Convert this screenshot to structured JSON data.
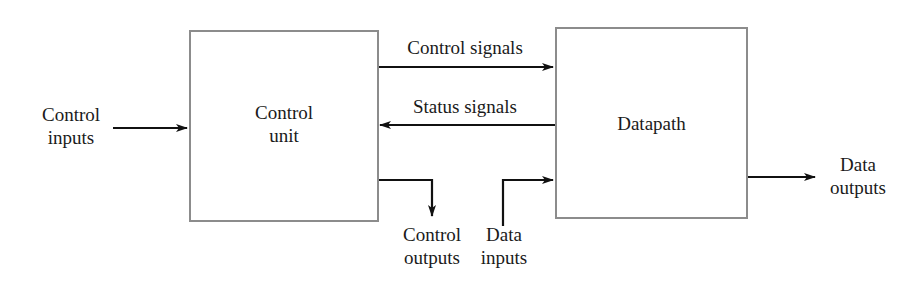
{
  "diagram": {
    "blocks": {
      "control_unit": {
        "label_line1": "Control",
        "label_line2": "unit"
      },
      "datapath": {
        "label": "Datapath"
      }
    },
    "signals": {
      "control_inputs": {
        "line1": "Control",
        "line2": "inputs"
      },
      "control_signals": {
        "label": "Control signals"
      },
      "status_signals": {
        "label": "Status signals"
      },
      "control_outputs": {
        "line1": "Control",
        "line2": "outputs"
      },
      "data_inputs": {
        "line1": "Data",
        "line2": "inputs"
      },
      "data_outputs": {
        "line1": "Data",
        "line2": "outputs"
      }
    },
    "colors": {
      "box_border": "#8c8c8c",
      "arrow": "#111111",
      "text": "#1a1a1a",
      "background": "#ffffff"
    }
  }
}
